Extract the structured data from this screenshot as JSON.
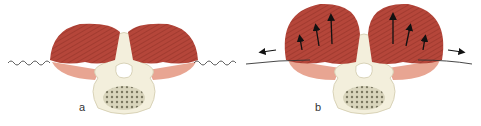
{
  "figure": {
    "panels": [
      {
        "id": "a",
        "label": "a",
        "description": "Paraspinal muscles resting, wavy fascia line"
      },
      {
        "id": "b",
        "label": "b",
        "description": "Paraspinal muscles expanded with arrows showing outward/upward pressure, taut fascia line"
      }
    ],
    "colors": {
      "muscle": "#b5463a",
      "muscle_dark": "#8f2f25",
      "muscle_light": "#e8a592",
      "bone": "#f3efdc",
      "bone_outline": "#d9d3b8",
      "cancellous": "#8c8a6e",
      "line": "#333333",
      "arrow": "#111111"
    }
  }
}
